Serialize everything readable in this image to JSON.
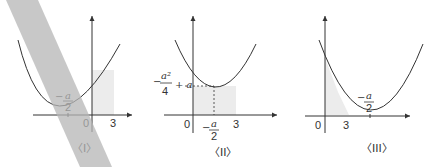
{
  "figures": [
    {
      "id": "I",
      "caption": "〈I〉",
      "labels": {
        "vertex_x_num": "a",
        "vertex_x_den": "2",
        "minus": "−",
        "origin": "0",
        "x_tick": "3"
      }
    },
    {
      "id": "II",
      "caption": "〈II〉",
      "labels": {
        "vertex_x_num": "a",
        "vertex_x_den": "2",
        "minus": "−",
        "origin": "0",
        "x_tick": "3",
        "vertex_y_num": "a²",
        "vertex_y_den": "4",
        "vertex_y_plus": "+ a"
      }
    },
    {
      "id": "III",
      "caption": "〈III〉",
      "labels": {
        "vertex_x_num": "a",
        "vertex_x_den": "2",
        "minus": "−",
        "origin": "0",
        "x_tick": "3"
      }
    }
  ],
  "colors": {
    "curve": "#333333",
    "shade": "#ececec",
    "band": "#b5b5b5"
  }
}
